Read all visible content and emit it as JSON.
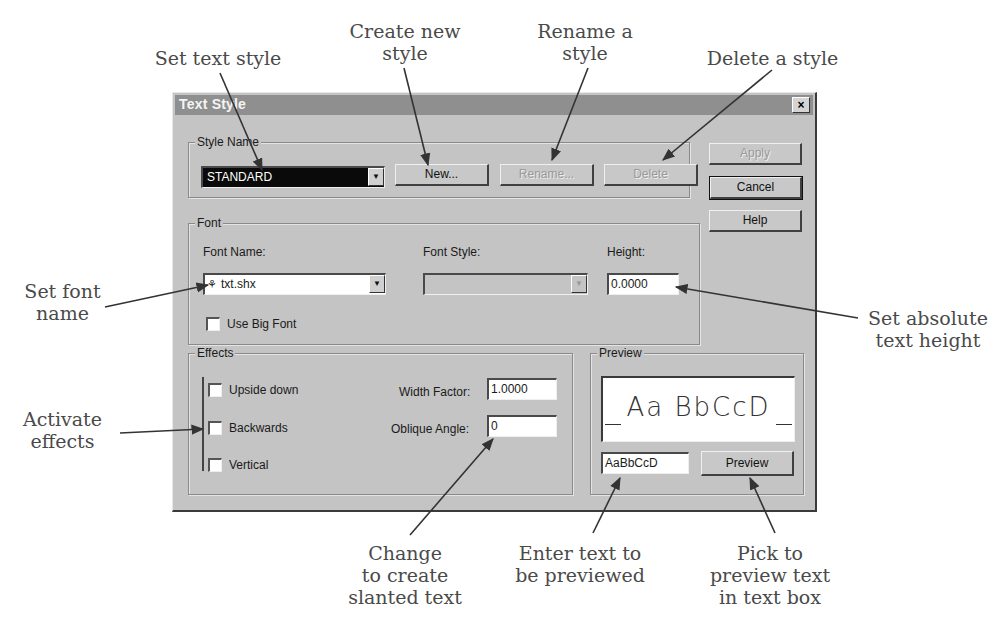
{
  "dialog": {
    "title": "Text Style",
    "close_glyph": "×",
    "style_name": {
      "group_label": "Style Name",
      "value": "STANDARD",
      "new_label": "New...",
      "rename_label": "Rename...",
      "delete_label": "Delete"
    },
    "side_buttons": {
      "apply_label": "Apply",
      "cancel_label": "Cancel",
      "help_label": "Help"
    },
    "font": {
      "group_label": "Font",
      "font_name_label": "Font Name:",
      "font_name_value": "txt.shx",
      "font_style_label": "Font Style:",
      "font_style_value": "",
      "height_label": "Height:",
      "height_value": "0.0000",
      "use_big_font_label": "Use Big Font",
      "use_big_font_checked": false
    },
    "effects": {
      "group_label": "Effects",
      "upside_down_label": "Upside down",
      "backwards_label": "Backwards",
      "vertical_label": "Vertical",
      "width_factor_label": "Width Factor:",
      "width_factor_value": "1.0000",
      "oblique_angle_label": "Oblique Angle:",
      "oblique_angle_value": "0"
    },
    "preview": {
      "group_label": "Preview",
      "sample_display": "Aa BbCcD",
      "input_value": "AaBbCcD",
      "button_label": "Preview"
    }
  },
  "callouts": {
    "set_text_style": "Set text style",
    "create_new_style": "Create new\nstyle",
    "rename_style": "Rename a\nstyle",
    "delete_style": "Delete a style",
    "set_font_name": "Set font\nname",
    "set_absolute_height": "Set absolute\ntext height",
    "activate_effects": "Activate\neffects",
    "change_slanted": "Change\nto create\nslanted text",
    "enter_preview_text": "Enter text to\nbe previewed",
    "pick_to_preview": "Pick to\npreview text\nin text box"
  },
  "colors": {
    "dialog_face": "#c4c4c4",
    "titlebar": "#8f8f8f",
    "callout_text": "#4a4a4a",
    "arrow": "#333333"
  }
}
